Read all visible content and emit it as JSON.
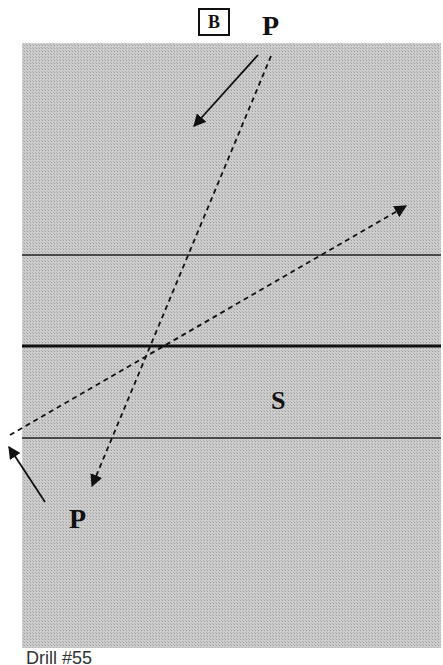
{
  "figure": {
    "panel_label": "B",
    "labels": {
      "p_top": "P",
      "p_bottom": "P",
      "s": "S"
    },
    "caption": "Drill #55"
  },
  "colors": {
    "background": "#ffffff",
    "panel_fill": "#c4c4c4",
    "line": "#111111"
  }
}
